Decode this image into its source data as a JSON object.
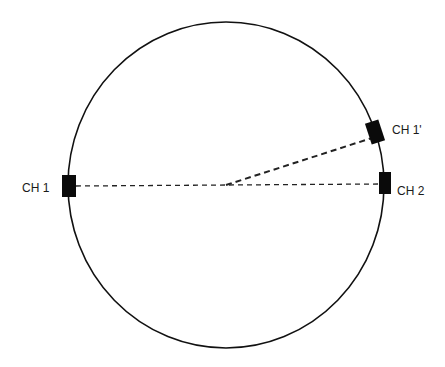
{
  "diagram": {
    "labels": {
      "ch1": "CH 1",
      "ch1_prime": "CH 1'",
      "ch2": "CH 2"
    },
    "colors": {
      "stroke": "#111111",
      "sensor": "#0a0a0a",
      "background": "#ffffff"
    }
  }
}
